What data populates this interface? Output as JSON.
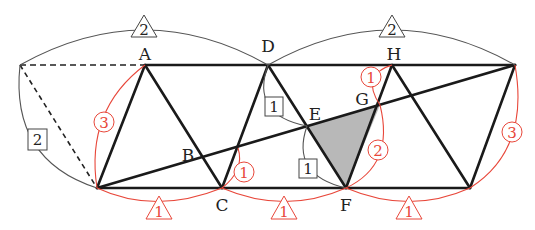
{
  "diagram": {
    "colors": {
      "line": "#1a1a1a",
      "ratio_red": "#e8473a",
      "shade": "#b8b8b8",
      "thin": "#555555"
    },
    "points": {
      "A": "A",
      "B": "B",
      "C": "C",
      "D": "D",
      "E": "E",
      "F": "F",
      "G": "G",
      "H": "H"
    },
    "black_triangle_labels": {
      "top_left": "2",
      "top_right": "2"
    },
    "black_box_labels": {
      "left_side": "2",
      "DE": "1",
      "EF": "1"
    },
    "red_circle_labels": {
      "A_to_base": "3",
      "C_to_B": "1",
      "H_to_G": "1",
      "G_to_F": "2",
      "right_side": "3"
    },
    "red_triangle_labels": {
      "base_1": "1",
      "base_2": "1",
      "base_3": "1"
    }
  }
}
